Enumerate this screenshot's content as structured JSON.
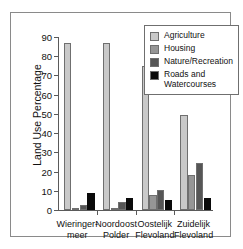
{
  "chart_data": {
    "type": "bar",
    "title": "",
    "xlabel": "",
    "ylabel": "Land Use Percentage",
    "ylim": [
      0,
      90
    ],
    "yticks": [
      0,
      10,
      20,
      30,
      40,
      50,
      60,
      70,
      80,
      90
    ],
    "grid": false,
    "legend_position": "top-right",
    "categories": [
      "Wieringer-\nmeer",
      "Noordoost\nPolder",
      "Oostelijk\nFlevoland",
      "Zuidelijk\nFlevoland"
    ],
    "category_lines": [
      [
        "Wieringer-",
        "meer"
      ],
      [
        "Noordoost",
        "Polder"
      ],
      [
        "Oostelijk",
        "Flevoland"
      ],
      [
        "Zuidelijk",
        "Flevoland"
      ]
    ],
    "series": [
      {
        "name": "Agriculture",
        "color": "#c9c9c9",
        "values": [
          87.0,
          86.7,
          74.7,
          49.5
        ]
      },
      {
        "name": "Housing",
        "color": "#969696",
        "values": [
          0.6,
          0.7,
          7.7,
          18.0
        ]
      },
      {
        "name": "Nature/Recreation",
        "color": "#565656",
        "values": [
          2.5,
          4.3,
          10.6,
          24.5
        ]
      },
      {
        "name": "Roads and Watercourses",
        "color": "#0a0a0a",
        "values": [
          8.7,
          6.4,
          5.3,
          6.3
        ]
      }
    ]
  },
  "legend": {
    "entries": [
      {
        "label_lines": [
          "Agriculture"
        ]
      },
      {
        "label_lines": [
          "Housing"
        ]
      },
      {
        "label_lines": [
          "Nature/Recreation"
        ]
      },
      {
        "label_lines": [
          "Roads and",
          "Watercourses"
        ]
      }
    ]
  }
}
